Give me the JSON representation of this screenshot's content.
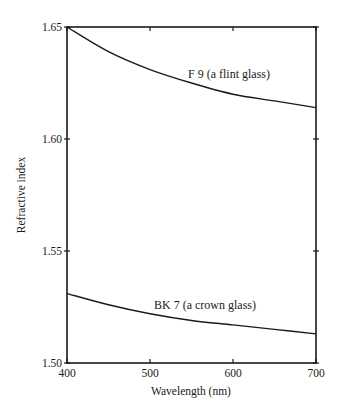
{
  "chart_data": {
    "type": "line",
    "title": "",
    "xlabel": "Wavelength (nm)",
    "ylabel": "Refractive index",
    "xlim": [
      400,
      700
    ],
    "ylim": [
      1.5,
      1.65
    ],
    "xticks": [
      "400",
      "500",
      "600",
      "700"
    ],
    "yticks": [
      "1.50",
      "1.55",
      "1.60",
      "1.65"
    ],
    "grid": false,
    "legend": "inline labels",
    "x": [
      400,
      450,
      500,
      550,
      600,
      650,
      700
    ],
    "series": [
      {
        "name": "F 9 (a flint glass)",
        "values": [
          1.65,
          1.639,
          1.631,
          1.625,
          1.62,
          1.617,
          1.614
        ]
      },
      {
        "name": "BK 7 (a crown glass)",
        "values": [
          1.531,
          1.526,
          1.522,
          1.519,
          1.517,
          1.515,
          1.513
        ]
      }
    ]
  }
}
